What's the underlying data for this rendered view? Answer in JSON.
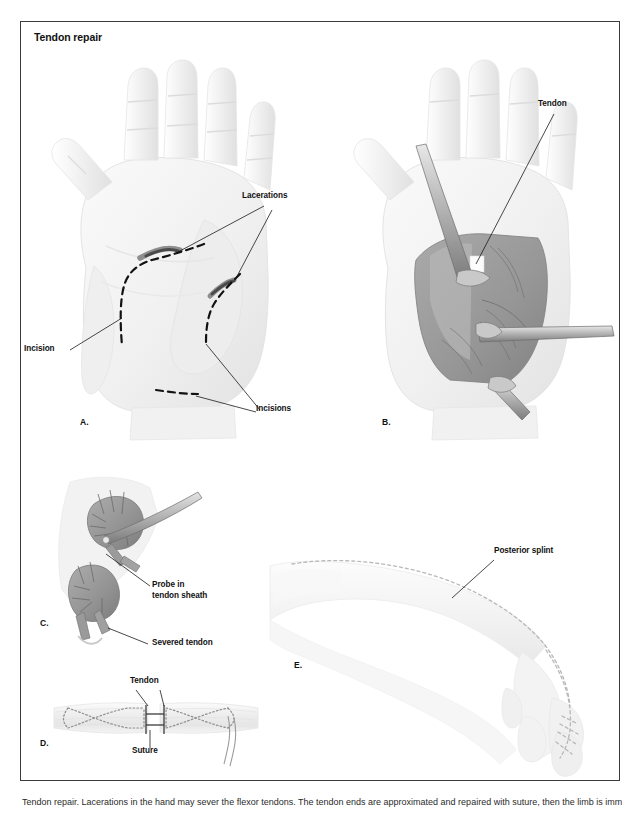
{
  "figure": {
    "title": "Tendon repair",
    "border_color": "#3c3c3c",
    "background": "#ffffff"
  },
  "palette": {
    "skin_light": "#f4f4f4",
    "skin_shade": "#e6e6e6",
    "skin_deep": "#d8d8d8",
    "tissue_gray": "#9d9d9d",
    "tissue_dark": "#7e7e7e",
    "metal_light": "#d5d5d5",
    "metal_dark": "#8c8c8c",
    "ink": "#111111",
    "leader": "#1a1a1a",
    "dotted": "#b5b5b5"
  },
  "panels": [
    {
      "id": "A",
      "letter": "A.",
      "description": "Palmar view of hand showing lacerations and planned incisions",
      "labels": [
        {
          "key": "lacerations",
          "text": "Lacerations"
        },
        {
          "key": "incision",
          "text": "Incision"
        },
        {
          "key": "incisions",
          "text": "Incisions"
        }
      ]
    },
    {
      "id": "B",
      "letter": "B.",
      "description": "Palm opened with retractors exposing the tendon",
      "labels": [
        {
          "key": "tendon",
          "text": "Tendon"
        }
      ]
    },
    {
      "id": "C",
      "letter": "C.",
      "description": "Close-up of tendon sheath with probe and severed tendon",
      "labels": [
        {
          "key": "probe",
          "text": "Probe in\ntendon sheath",
          "line1": "Probe in",
          "line2": "tendon sheath"
        },
        {
          "key": "severed",
          "text": "Severed tendon"
        }
      ]
    },
    {
      "id": "D",
      "letter": "D.",
      "description": "Sutured tendon repair, Kessler core stitch",
      "labels": [
        {
          "key": "tendon",
          "text": "Tendon"
        },
        {
          "key": "suture",
          "text": "Suture"
        }
      ]
    },
    {
      "id": "E",
      "letter": "E.",
      "description": "Arm and hand immobilized in posterior splint",
      "labels": [
        {
          "key": "splint",
          "text": "Posterior splint"
        }
      ]
    }
  ],
  "caption": {
    "text": "Tendon repair. Lacerations in the hand may sever the flexor tendons. The tendon ends are approximated and repaired with suture, then the limb is immobilized."
  }
}
